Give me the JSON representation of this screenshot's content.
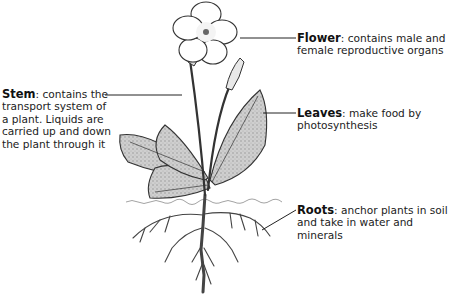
{
  "diagram": {
    "type": "labelled plant anatomy illustration",
    "labels": [
      {
        "id": "flower",
        "term": "Flower",
        "description": ": contains male and female reproductive organs",
        "line1_rest": ": contains male and",
        "line2": "female reproductive organs"
      },
      {
        "id": "stem",
        "term": "Stem",
        "description": ": contains the transport system of a plant. Liquids are carried up and down the plant through it",
        "line1_rest": ": contains the",
        "line2": "transport system of",
        "line3": "a plant. Liquids are",
        "line4": "carried up and down",
        "line5": "the plant through it"
      },
      {
        "id": "leaves",
        "term": "Leaves",
        "description": ": make food by photosynthesis",
        "line1_rest": ": make food by",
        "line2": "photosynthesis"
      },
      {
        "id": "roots",
        "term": "Roots",
        "description": ": anchor plants in soil and take in water and minerals",
        "line1_rest": ": anchor plants in soil",
        "line2": "and take in water and minerals"
      }
    ]
  }
}
